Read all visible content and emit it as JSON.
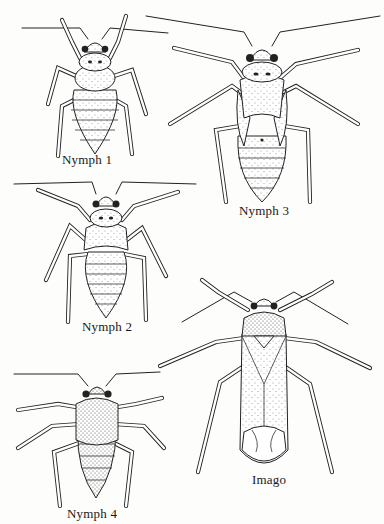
{
  "figure": {
    "type": "scientific-illustration",
    "ink_color": "#222222",
    "background": "#fdfdfb"
  },
  "specimens": [
    {
      "id": "nymph1",
      "label": "Nymph 1"
    },
    {
      "id": "nymph2",
      "label": "Nymph 2"
    },
    {
      "id": "nymph3",
      "label": "Nymph 3"
    },
    {
      "id": "nymph4",
      "label": "Nymph 4"
    },
    {
      "id": "imago",
      "label": "Imago"
    }
  ]
}
